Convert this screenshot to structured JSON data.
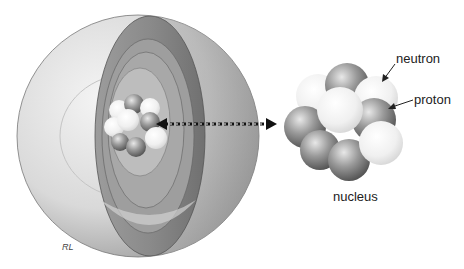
{
  "diagram": {
    "labels": {
      "neutron": "neutron",
      "proton": "proton",
      "nucleus": "nucleus"
    },
    "signature": "RL",
    "colors": {
      "background": "#ffffff",
      "shell_light": "#e6e6e6",
      "shell_dark": "#8a8a8a",
      "proton": "#7a7a7a",
      "neutron": "#f0f0f0",
      "text": "#222222"
    }
  }
}
